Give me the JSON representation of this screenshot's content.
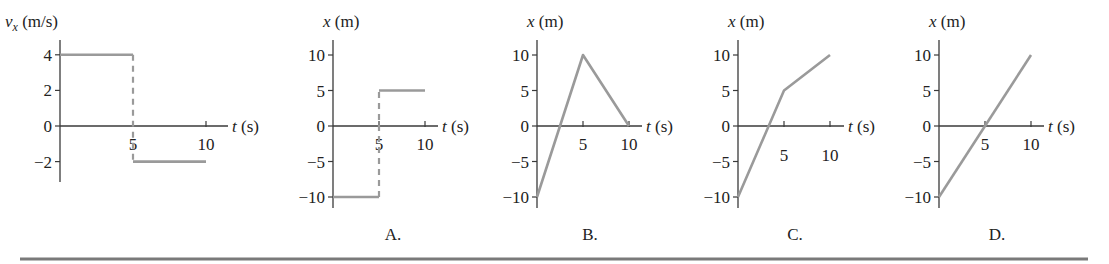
{
  "chart_data": [
    {
      "id": "given",
      "type": "line",
      "panel_label": "",
      "ylabel_var": "v",
      "ylabel_sub": "x",
      "ylabel_unit": " (m/s)",
      "xlabel_var": "t",
      "xlabel_unit": " (s)",
      "xlim": [
        0,
        11.5
      ],
      "ylim": [
        -3,
        4.8
      ],
      "yticks": [
        4,
        2,
        0,
        -2
      ],
      "ytick_labels": [
        "4",
        "2",
        "0",
        "−2"
      ],
      "xticks": [
        5,
        10
      ],
      "xtick_labels": [
        "5",
        "10"
      ],
      "series": [
        {
          "name": "segment-1",
          "style": "solid",
          "x": [
            0,
            5
          ],
          "y": [
            4,
            4
          ]
        },
        {
          "name": "jump",
          "style": "dashed",
          "x": [
            5,
            5
          ],
          "y": [
            4,
            -2
          ]
        },
        {
          "name": "segment-2",
          "style": "solid",
          "x": [
            5,
            10
          ],
          "y": [
            -2,
            -2
          ]
        }
      ]
    },
    {
      "id": "A",
      "type": "line",
      "panel_label": "A.",
      "ylabel_var": "x",
      "ylabel_sub": "",
      "ylabel_unit": " (m)",
      "xlabel_var": "t",
      "xlabel_unit": " (s)",
      "xlim": [
        0,
        11.5
      ],
      "ylim": [
        -11.5,
        12.5
      ],
      "yticks": [
        10,
        5,
        0,
        -5,
        -10
      ],
      "ytick_labels": [
        "10",
        "5",
        "0",
        "−5",
        "−10"
      ],
      "xticks": [
        5,
        10
      ],
      "xtick_labels": [
        "5",
        "10"
      ],
      "series": [
        {
          "name": "segment-1",
          "style": "solid",
          "x": [
            0,
            5
          ],
          "y": [
            -10,
            -10
          ]
        },
        {
          "name": "jump",
          "style": "dashed",
          "x": [
            5,
            5
          ],
          "y": [
            -10,
            5
          ]
        },
        {
          "name": "segment-2",
          "style": "solid",
          "x": [
            5,
            10
          ],
          "y": [
            5,
            5
          ]
        }
      ]
    },
    {
      "id": "B",
      "type": "line",
      "panel_label": "B.",
      "ylabel_var": "x",
      "ylabel_sub": "",
      "ylabel_unit": " (m)",
      "xlabel_var": "t",
      "xlabel_unit": " (s)",
      "xlim": [
        0,
        11.5
      ],
      "ylim": [
        -11.5,
        12.5
      ],
      "yticks": [
        10,
        5,
        0,
        -5,
        -10
      ],
      "ytick_labels": [
        "10",
        "5",
        "0",
        "−5",
        "−10"
      ],
      "xticks": [
        5,
        10
      ],
      "xtick_labels": [
        "5",
        "10"
      ],
      "series": [
        {
          "name": "position",
          "style": "solid",
          "x": [
            0,
            5,
            10
          ],
          "y": [
            -10,
            10,
            0
          ]
        }
      ]
    },
    {
      "id": "C",
      "type": "line",
      "panel_label": "C.",
      "ylabel_var": "x",
      "ylabel_sub": "",
      "ylabel_unit": " (m)",
      "xlabel_var": "t",
      "xlabel_unit": " (s)",
      "xlim": [
        0,
        11.5
      ],
      "ylim": [
        -11.5,
        12.5
      ],
      "yticks": [
        10,
        5,
        0,
        -5,
        -10
      ],
      "ytick_labels": [
        "10",
        "5",
        "0",
        "−5",
        "−10"
      ],
      "xticks": [
        5,
        10
      ],
      "xtick_labels": [
        "5",
        "10"
      ],
      "xtick_labels_below": true,
      "series": [
        {
          "name": "position",
          "style": "solid",
          "x": [
            0,
            5,
            10
          ],
          "y": [
            -10,
            5,
            10
          ]
        }
      ]
    },
    {
      "id": "D",
      "type": "line",
      "panel_label": "D.",
      "ylabel_var": "x",
      "ylabel_sub": "",
      "ylabel_unit": " (m)",
      "xlabel_var": "t",
      "xlabel_unit": " (s)",
      "xlim": [
        0,
        11.5
      ],
      "ylim": [
        -11.5,
        12.5
      ],
      "yticks": [
        10,
        5,
        0,
        -5,
        -10
      ],
      "ytick_labels": [
        "10",
        "5",
        "0",
        "−5",
        "−10"
      ],
      "xticks": [
        5,
        10
      ],
      "xtick_labels": [
        "5",
        "10"
      ],
      "series": [
        {
          "name": "position",
          "style": "solid",
          "x": [
            0,
            10
          ],
          "y": [
            -10,
            10
          ]
        }
      ]
    }
  ]
}
